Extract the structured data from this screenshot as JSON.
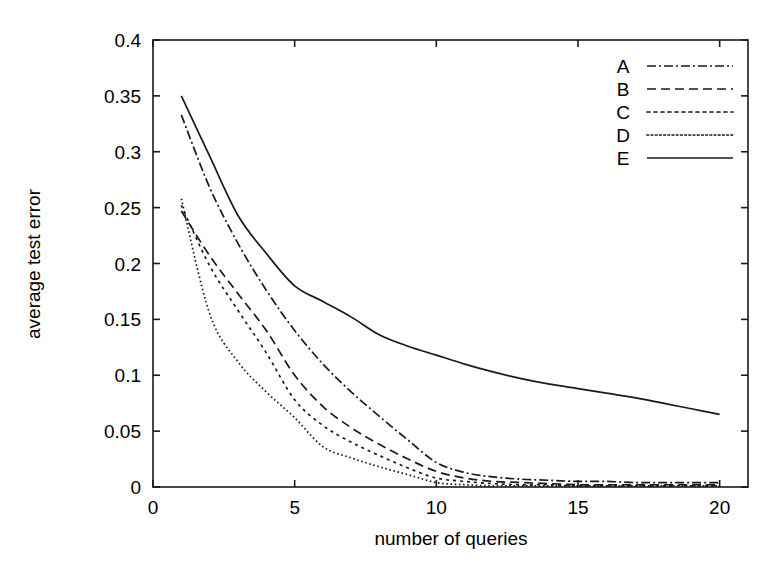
{
  "chart_data": {
    "type": "line",
    "title": "",
    "xlabel": "number of queries",
    "ylabel": "average test error",
    "xlim": [
      0,
      21
    ],
    "ylim": [
      0,
      0.4
    ],
    "grid": false,
    "legend_position": "top-right",
    "xticks": [
      "0",
      "5",
      "10",
      "15",
      "20"
    ],
    "xtick_values": [
      0,
      5,
      10,
      15,
      20
    ],
    "yticks": [
      "0",
      "0.05",
      "0.1",
      "0.15",
      "0.2",
      "0.25",
      "0.3",
      "0.35",
      "0.4"
    ],
    "ytick_values": [
      0,
      0.05,
      0.1,
      0.15,
      0.2,
      0.25,
      0.3,
      0.35,
      0.4
    ],
    "x": [
      1,
      2,
      3,
      4,
      5,
      6,
      7,
      8,
      9,
      10,
      11,
      12,
      13,
      14,
      15,
      16,
      17,
      18,
      19,
      20
    ],
    "series": [
      {
        "name": "A",
        "dash": "dash-dot",
        "values": [
          0.333,
          0.268,
          0.218,
          0.176,
          0.14,
          0.11,
          0.085,
          0.063,
          0.042,
          0.022,
          0.013,
          0.009,
          0.007,
          0.006,
          0.005,
          0.005,
          0.004,
          0.004,
          0.004,
          0.004
        ]
      },
      {
        "name": "B",
        "dash": "dashed",
        "values": [
          0.247,
          0.207,
          0.173,
          0.14,
          0.1,
          0.072,
          0.053,
          0.038,
          0.025,
          0.014,
          0.008,
          0.005,
          0.004,
          0.003,
          0.002,
          0.002,
          0.002,
          0.002,
          0.002,
          0.002
        ]
      },
      {
        "name": "C",
        "dash": "dotted",
        "values": [
          0.252,
          0.198,
          0.158,
          0.12,
          0.078,
          0.055,
          0.04,
          0.028,
          0.017,
          0.008,
          0.005,
          0.003,
          0.002,
          0.002,
          0.001,
          0.001,
          0.001,
          0.001,
          0.001,
          0.001
        ]
      },
      {
        "name": "D",
        "dash": "fine-dotted",
        "values": [
          0.258,
          0.155,
          0.112,
          0.085,
          0.062,
          0.036,
          0.026,
          0.018,
          0.011,
          0.004,
          0.002,
          0.001,
          0.001,
          0.001,
          0.001,
          0.001,
          0.001,
          0.001,
          0.001,
          0.001
        ]
      },
      {
        "name": "E",
        "dash": "solid",
        "values": [
          0.35,
          0.296,
          0.243,
          0.209,
          0.18,
          0.166,
          0.152,
          0.136,
          0.126,
          0.118,
          0.11,
          0.103,
          0.097,
          0.092,
          0.088,
          0.084,
          0.08,
          0.075,
          0.07,
          0.065
        ]
      }
    ]
  }
}
